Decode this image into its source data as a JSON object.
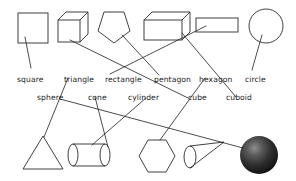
{
  "worksheet": {
    "title": "Shape matching worksheet",
    "background_color": "#ffffff",
    "ink_color": "#2b2b2b"
  },
  "labels_row_2d": [
    {
      "id": "square",
      "text": "square",
      "x": 17,
      "y": 75
    },
    {
      "id": "triangle",
      "text": "triangle",
      "x": 64,
      "y": 75
    },
    {
      "id": "rectangle",
      "text": "rectangle",
      "x": 105,
      "y": 75
    },
    {
      "id": "pentagon",
      "text": "pentagon",
      "x": 154,
      "y": 75
    },
    {
      "id": "hexagon",
      "text": "hexagon",
      "x": 199,
      "y": 75
    },
    {
      "id": "circle",
      "text": "circle",
      "x": 245,
      "y": 75
    }
  ],
  "labels_row_3d": [
    {
      "id": "sphere",
      "text": "sphere",
      "x": 37,
      "y": 93
    },
    {
      "id": "cone",
      "text": "cone",
      "x": 88,
      "y": 93
    },
    {
      "id": "cylinder",
      "text": "cylinder",
      "x": 128,
      "y": 93
    },
    {
      "id": "cube",
      "text": "cube",
      "x": 188,
      "y": 93
    },
    {
      "id": "cuboid",
      "text": "cuboid",
      "x": 226,
      "y": 93
    }
  ],
  "shapes_top": [
    {
      "id": "square-shape",
      "name": "square",
      "kind": "2d"
    },
    {
      "id": "cube-shape",
      "name": "cube",
      "kind": "3d"
    },
    {
      "id": "pentagon-shape",
      "name": "pentagon",
      "kind": "2d"
    },
    {
      "id": "cuboid-shape",
      "name": "cuboid",
      "kind": "3d"
    },
    {
      "id": "rectangle-shape",
      "name": "rectangle",
      "kind": "2d"
    },
    {
      "id": "circle-shape",
      "name": "circle",
      "kind": "2d"
    }
  ],
  "shapes_bottom": [
    {
      "id": "triangle-shape",
      "name": "triangle",
      "kind": "2d"
    },
    {
      "id": "cylinder-shape",
      "name": "cylinder",
      "kind": "3d"
    },
    {
      "id": "hexagon-shape",
      "name": "hexagon",
      "kind": "2d"
    },
    {
      "id": "cone-shape",
      "name": "cone",
      "kind": "3d"
    },
    {
      "id": "sphere-shape",
      "name": "sphere",
      "kind": "3d"
    }
  ],
  "connections": [
    {
      "from": "square-shape",
      "to": "square"
    },
    {
      "from": "cube-shape",
      "to": "cube"
    },
    {
      "from": "pentagon-shape",
      "to": "pentagon"
    },
    {
      "from": "cuboid-shape",
      "to": "cuboid"
    },
    {
      "from": "rectangle-shape",
      "to": "rectangle"
    },
    {
      "from": "circle-shape",
      "to": "circle"
    },
    {
      "from": "triangle-shape",
      "to": "triangle"
    },
    {
      "from": "cylinder-shape",
      "to": "cylinder"
    },
    {
      "from": "hexagon-shape",
      "to": "hexagon"
    },
    {
      "from": "cone-shape",
      "to": "cone"
    },
    {
      "from": "sphere-shape",
      "to": "sphere"
    }
  ]
}
